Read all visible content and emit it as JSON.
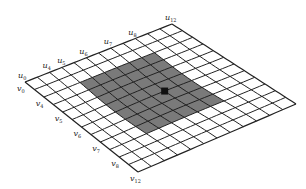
{
  "diagram": {
    "grid": {
      "n_u": 12,
      "n_v": 12,
      "corners": {
        "p00": [
          25,
          82
        ],
        "pU": [
          172,
          24
        ],
        "pUV": [
          296,
          104
        ],
        "pV": [
          138,
          172
        ]
      },
      "warp": {
        "ax": 0,
        "ay": -14,
        "bx": -6,
        "by": 10
      }
    },
    "shaded_region": {
      "u_start": 3,
      "u_end": 9,
      "v_start": 2,
      "v_end": 9,
      "color": "#7a7a7a"
    },
    "marker": {
      "u": 7,
      "v": 6,
      "size": 7,
      "color": "#111111"
    },
    "line_color": "#222222",
    "u_labels": [
      {
        "text": "u",
        "sub": "0",
        "index": 0
      },
      {
        "text": "u",
        "sub": "4",
        "index": 2
      },
      {
        "text": "u",
        "sub": "5",
        "index": 3.2
      },
      {
        "text": "u",
        "sub": "6",
        "index": 5
      },
      {
        "text": "u",
        "sub": "7",
        "index": 7
      },
      {
        "text": "u",
        "sub": "8",
        "index": 9
      },
      {
        "text": "u",
        "sub": "12",
        "index": 12
      }
    ],
    "v_labels": [
      {
        "text": "v",
        "sub": "0",
        "index": 0
      },
      {
        "text": "v",
        "sub": "4",
        "index": 2
      },
      {
        "text": "v",
        "sub": "5",
        "index": 4
      },
      {
        "text": "v",
        "sub": "6",
        "index": 6
      },
      {
        "text": "v",
        "sub": "7",
        "index": 8
      },
      {
        "text": "v",
        "sub": "8",
        "index": 10
      },
      {
        "text": "v",
        "sub": "12",
        "index": 12
      }
    ]
  }
}
